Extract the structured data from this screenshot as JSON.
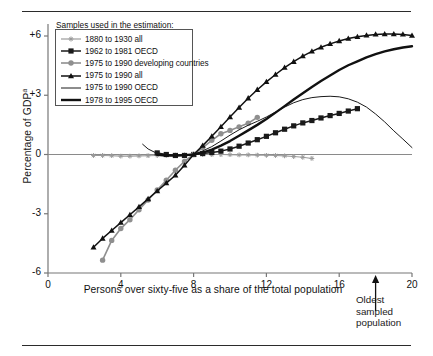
{
  "figure": {
    "y_axis_label": "Percentage of GDP",
    "y_axis_label_superscript": "a",
    "x_axis_label": "Persons over sixty-five as a share of the total population",
    "legend_title": "Samples used in the estimation:",
    "annotation": {
      "line1": "Oldest",
      "line2": "sampled",
      "line3": "population",
      "arrow_x_value": 18
    },
    "y_ticks": [
      "+6",
      "+3",
      "0",
      "-3",
      "-6"
    ],
    "x_ticks": [
      "0",
      "4",
      "8",
      "12",
      "16",
      "20"
    ]
  },
  "chart_data": {
    "type": "line",
    "title": "",
    "xlabel": "Persons over sixty-five as a share of the total population",
    "ylabel": "Percentage of GDP",
    "xlim": [
      0,
      20
    ],
    "ylim": [
      -6,
      6
    ],
    "xticks": [
      0,
      4,
      8,
      12,
      16,
      20
    ],
    "yticks": [
      -6,
      -3,
      0,
      3,
      6
    ],
    "grid": false,
    "legend_position": "upper-left-inside",
    "zero_line": true,
    "annotations": [
      {
        "text": "Oldest sampled population",
        "x": 18,
        "y": -6,
        "type": "arrow-up"
      }
    ],
    "series": [
      {
        "name": "1880 to 1930 all",
        "color": "#9a9a9a",
        "marker": "star-small",
        "linewidth": 1.1,
        "x": [
          2.5,
          3.0,
          3.5,
          4.0,
          4.5,
          5.0,
          5.5,
          6.0,
          6.5,
          7.0,
          7.5,
          8.0,
          8.5,
          9.0,
          9.5,
          10.0,
          10.5,
          11.0,
          11.5,
          12.0,
          12.5,
          13.0,
          13.5,
          14.0,
          14.5
        ],
        "y": [
          -0.05,
          -0.05,
          -0.06,
          -0.08,
          -0.08,
          -0.07,
          -0.06,
          -0.05,
          -0.04,
          -0.03,
          -0.02,
          0.0,
          0.0,
          0.0,
          0.0,
          -0.01,
          -0.02,
          -0.02,
          -0.03,
          -0.04,
          -0.05,
          -0.07,
          -0.1,
          -0.14,
          -0.2
        ]
      },
      {
        "name": "1962 to 1981 OECD",
        "color": "#1a1a1a",
        "marker": "square",
        "linewidth": 1.5,
        "x": [
          6.0,
          6.5,
          7.0,
          7.5,
          8.0,
          8.5,
          9.0,
          9.5,
          10.0,
          10.5,
          11.0,
          11.5,
          12.0,
          12.5,
          13.0,
          13.5,
          14.0,
          14.5,
          15.0,
          15.5,
          16.0,
          16.5,
          17.0
        ],
        "y": [
          0.08,
          0.0,
          -0.05,
          -0.05,
          0.0,
          0.05,
          0.1,
          0.17,
          0.28,
          0.42,
          0.58,
          0.75,
          0.92,
          1.1,
          1.28,
          1.45,
          1.6,
          1.72,
          1.85,
          1.97,
          2.08,
          2.2,
          2.32
        ]
      },
      {
        "name": "1975 to 1990 developing countries",
        "color": "#8f8f8f",
        "marker": "circle",
        "linewidth": 1.6,
        "x": [
          3.0,
          3.5,
          4.0,
          4.5,
          5.0,
          5.5,
          6.0,
          6.5,
          7.0,
          7.5,
          8.0,
          8.5,
          9.0,
          9.5,
          10.0,
          10.5,
          11.0,
          11.5
        ],
        "y": [
          -5.35,
          -4.35,
          -3.75,
          -3.3,
          -2.8,
          -2.3,
          -1.8,
          -1.3,
          -0.8,
          -0.35,
          0.0,
          0.35,
          0.72,
          1.05,
          1.22,
          1.4,
          1.58,
          1.88
        ]
      },
      {
        "name": "1975 to 1990 all",
        "color": "#111111",
        "marker": "triangle",
        "linewidth": 1.5,
        "x": [
          2.5,
          3.0,
          3.5,
          4.0,
          4.5,
          5.0,
          5.5,
          6.0,
          6.5,
          7.0,
          7.5,
          8.0,
          8.5,
          9.0,
          9.5,
          10.0,
          10.5,
          11.0,
          11.5,
          12.0,
          12.5,
          13.0,
          13.5,
          14.0,
          14.5,
          15.0,
          15.5,
          16.0,
          16.5,
          17.0,
          17.5,
          18.0,
          18.5,
          19.0,
          19.5,
          20.0
        ],
        "y": [
          -4.7,
          -4.25,
          -3.85,
          -3.45,
          -3.05,
          -2.65,
          -2.25,
          -1.85,
          -1.45,
          -1.05,
          -0.55,
          0.0,
          0.45,
          0.92,
          1.4,
          1.9,
          2.38,
          2.85,
          3.28,
          3.68,
          4.05,
          4.4,
          4.7,
          4.98,
          5.22,
          5.43,
          5.6,
          5.75,
          5.87,
          5.96,
          6.03,
          6.08,
          6.1,
          6.1,
          6.08,
          6.02
        ]
      },
      {
        "name": "1975 to 1990 OECD",
        "color": "#1a1a1a",
        "marker": "none",
        "linewidth": 1.0,
        "x": [
          5.2,
          5.5,
          6.0,
          6.5,
          7.0,
          7.5,
          8.0,
          8.5,
          9.0,
          9.5,
          10.0,
          10.5,
          11.0,
          11.5,
          12.0,
          12.5,
          13.0,
          13.5,
          14.0,
          14.5,
          15.0,
          15.5,
          16.0,
          16.5,
          17.0,
          17.5,
          18.0,
          18.5,
          19.0,
          19.5,
          20.0
        ],
        "y": [
          0.52,
          0.28,
          0.05,
          -0.05,
          -0.05,
          -0.02,
          0.0,
          0.18,
          0.4,
          0.68,
          0.98,
          1.25,
          1.48,
          1.68,
          1.9,
          2.15,
          2.4,
          2.62,
          2.78,
          2.88,
          2.93,
          2.95,
          2.92,
          2.82,
          2.65,
          2.4,
          2.05,
          1.65,
          1.2,
          0.78,
          0.35
        ]
      },
      {
        "name": "1978 to 1995 OECD",
        "color": "#111111",
        "marker": "none",
        "linewidth": 2.4,
        "x": [
          6.0,
          6.5,
          7.0,
          7.5,
          8.0,
          8.5,
          9.0,
          9.5,
          10.0,
          10.5,
          11.0,
          11.5,
          12.0,
          12.5,
          13.0,
          13.5,
          14.0,
          14.5,
          15.0,
          15.5,
          16.0,
          16.5,
          17.0,
          17.5,
          18.0,
          18.5,
          19.0,
          19.5,
          20.0
        ],
        "y": [
          -0.02,
          -0.05,
          -0.05,
          -0.03,
          0.0,
          0.1,
          0.25,
          0.45,
          0.68,
          0.95,
          1.22,
          1.5,
          1.8,
          2.12,
          2.45,
          2.78,
          3.1,
          3.42,
          3.72,
          4.0,
          4.28,
          4.52,
          4.72,
          4.92,
          5.08,
          5.22,
          5.33,
          5.42,
          5.48
        ]
      }
    ]
  }
}
